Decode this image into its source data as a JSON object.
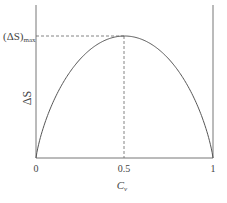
{
  "chart_data": {
    "type": "line",
    "title": "",
    "xlabel": "C_v",
    "ylabel": "ΔS",
    "xlim": [
      0,
      1
    ],
    "ylim": [
      0,
      1
    ],
    "x_ticks": [
      "0",
      "0.5",
      "1"
    ],
    "annotations": [
      {
        "text": "(ΔS)max",
        "x": 0.5,
        "y": 1.0,
        "note": "dashed guide lines from peak to y-axis and down to x=0.5"
      }
    ],
    "series": [
      {
        "name": "ΔS vs C_v",
        "x": [
          0,
          0.02,
          0.05,
          0.1,
          0.2,
          0.3,
          0.4,
          0.5,
          0.6,
          0.7,
          0.8,
          0.9,
          0.95,
          0.98,
          1
        ],
        "y": [
          0,
          0.23,
          0.39,
          0.57,
          0.79,
          0.91,
          0.98,
          1.0,
          0.98,
          0.91,
          0.79,
          0.57,
          0.39,
          0.23,
          0
        ]
      }
    ],
    "grid": false,
    "legend": null
  },
  "labels": {
    "ymax": "(ΔS)",
    "ymax_sub": "max",
    "ylabel": "ΔS",
    "xlabel": "C",
    "xlabel_sub": "v",
    "tick0": "0",
    "tick05": "0.5",
    "tick1": "1"
  }
}
